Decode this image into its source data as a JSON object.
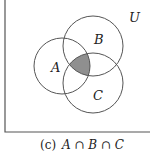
{
  "diagram": {
    "type": "venn",
    "universe_label": "U",
    "sets": [
      {
        "label": "A",
        "cx": 62,
        "cy": 66,
        "r": 28
      },
      {
        "label": "B",
        "cx": 93,
        "cy": 46,
        "r": 30
      },
      {
        "label": "C",
        "cx": 93,
        "cy": 83,
        "r": 30
      }
    ],
    "shaded_region": "A ∩ B ∩ C",
    "shade_color": "#8f8f8f",
    "line_color": "#555555"
  },
  "caption": {
    "prefix": "(c)",
    "expression": "A ∩ B ∩ C"
  }
}
